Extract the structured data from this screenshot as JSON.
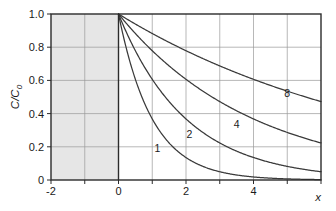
{
  "chart_data": {
    "type": "line",
    "title": "",
    "subtitle": "",
    "xlabel": "x",
    "ylabel": "C/C0",
    "ylabel_base": "C/C",
    "ylabel_sub": "0",
    "xlim": [
      -2,
      6
    ],
    "ylim": [
      0,
      1.0
    ],
    "grid": true,
    "legend_position": "inline-curve-labels",
    "x_ticks": [
      -2,
      -1,
      0,
      1,
      2,
      3,
      4,
      5,
      6
    ],
    "x_tick_labels": [
      "-2",
      "",
      "0",
      "",
      "2",
      "",
      "4",
      "",
      ""
    ],
    "y_ticks": [
      0,
      0.2,
      0.4,
      0.6,
      0.8,
      1.0
    ],
    "y_tick_labels": [
      "0",
      "0.2",
      "0.4",
      "0.6",
      "0.8",
      "1.0"
    ],
    "shaded_region": {
      "x_start": -2,
      "x_end": 0,
      "color": "#e6e6e6",
      "label": ""
    },
    "equation": "C/C0 = exp(-x/L)",
    "series": [
      {
        "name": "1",
        "label": "1",
        "decay_length": 1,
        "label_x": 1.15,
        "label_y": 0.17,
        "x": [
          0,
          0.25,
          0.5,
          0.75,
          1,
          1.25,
          1.5,
          1.75,
          2,
          2.5,
          3,
          3.5,
          4,
          4.5,
          5,
          5.5,
          6
        ],
        "values": [
          1.0,
          0.779,
          0.607,
          0.472,
          0.368,
          0.287,
          0.223,
          0.174,
          0.135,
          0.082,
          0.05,
          0.03,
          0.018,
          0.011,
          0.007,
          0.004,
          0.002
        ]
      },
      {
        "name": "2",
        "label": "2",
        "decay_length": 2,
        "label_x": 2.1,
        "label_y": 0.255,
        "x": [
          0,
          0.5,
          1,
          1.5,
          2,
          2.5,
          3,
          3.5,
          4,
          4.5,
          5,
          5.5,
          6
        ],
        "values": [
          1.0,
          0.779,
          0.607,
          0.472,
          0.368,
          0.287,
          0.223,
          0.174,
          0.135,
          0.105,
          0.082,
          0.064,
          0.05
        ]
      },
      {
        "name": "4",
        "label": "4",
        "decay_length": 4,
        "label_x": 3.5,
        "label_y": 0.315,
        "x": [
          0,
          0.5,
          1,
          1.5,
          2,
          2.5,
          3,
          3.5,
          4,
          4.5,
          5,
          5.5,
          6
        ],
        "values": [
          1.0,
          0.882,
          0.779,
          0.687,
          0.607,
          0.535,
          0.472,
          0.417,
          0.368,
          0.325,
          0.287,
          0.253,
          0.223
        ]
      },
      {
        "name": "8",
        "label": "8",
        "decay_length": 8,
        "label_x": 5.0,
        "label_y": 0.5,
        "x": [
          0,
          0.5,
          1,
          1.5,
          2,
          2.5,
          3,
          3.5,
          4,
          4.5,
          5,
          5.5,
          6
        ],
        "values": [
          1.0,
          0.939,
          0.882,
          0.829,
          0.779,
          0.732,
          0.687,
          0.646,
          0.607,
          0.57,
          0.535,
          0.503,
          0.472
        ]
      }
    ],
    "colors": {
      "curve": "#3a3a3a",
      "axis": "#2b2b2b",
      "grid": "#9a9a9a",
      "shade": "#e6e6e6",
      "background": "#ffffff",
      "text": "#1a1a1a"
    }
  }
}
